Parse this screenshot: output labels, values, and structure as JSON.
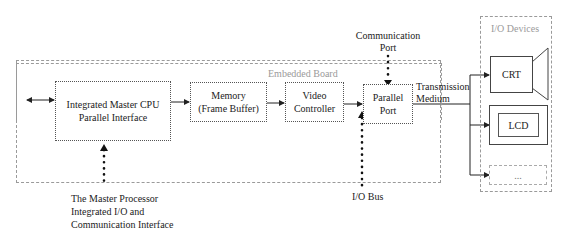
{
  "diagram": {
    "regions": {
      "embedded_board": "Embedded Board",
      "io_devices": "I/O Devices"
    },
    "blocks": {
      "cpu_line1": "Integrated Master CPU",
      "cpu_line2": "Parallel Interface",
      "memory_line1": "Memory",
      "memory_line2": "(Frame Buffer)",
      "video_line1": "Video",
      "video_line2": "Controller",
      "parallel_line1": "Parallel",
      "parallel_line2": "Port"
    },
    "devices": {
      "crt": "CRT",
      "lcd": "LCD",
      "more": "..."
    },
    "annotations": {
      "comm_port_line1": "Communication",
      "comm_port_line2": "Port",
      "transmission_line1": "Transmission",
      "transmission_line2": "Medium",
      "io_bus": "I/O Bus",
      "master_line1": "The Master Processor",
      "master_line2": "Integrated I/O and",
      "master_line3": "Communication Interface"
    }
  }
}
